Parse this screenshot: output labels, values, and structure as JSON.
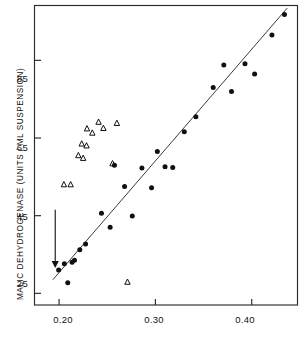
{
  "chart_data": {
    "type": "scatter",
    "title": "",
    "xlabel": "",
    "ylabel": "MALIC DEHYDROGENASE (UNITS / ML SUSPENSION)",
    "xlim": [
      0.175,
      0.447
    ],
    "ylim": [
      22.0,
      99.0
    ],
    "xticks": [
      0.2,
      0.3,
      0.4
    ],
    "xticklabels": [
      "0.20",
      "0.30",
      "0.40"
    ],
    "yticks": [
      25,
      45,
      65,
      85
    ],
    "yticklabels": [
      "25",
      "45",
      "65",
      "85"
    ],
    "grid": false,
    "legend": null,
    "frame": "box",
    "series": [
      {
        "name": "filled-circles",
        "marker": "filled-circle",
        "color": "#101010",
        "points": [
          [
            0.1995,
            31.0
          ],
          [
            0.2055,
            32.6
          ],
          [
            0.209,
            27.7
          ],
          [
            0.2135,
            33.0
          ],
          [
            0.216,
            33.5
          ],
          [
            0.2215,
            36.2
          ],
          [
            0.2275,
            37.7
          ],
          [
            0.244,
            45.6
          ],
          [
            0.253,
            42.0
          ],
          [
            0.2575,
            58.0
          ],
          [
            0.268,
            52.5
          ],
          [
            0.276,
            44.9
          ],
          [
            0.286,
            57.3
          ],
          [
            0.296,
            52.2
          ],
          [
            0.302,
            61.5
          ],
          [
            0.31,
            57.6
          ],
          [
            0.318,
            57.4
          ],
          [
            0.33,
            66.6
          ],
          [
            0.342,
            70.5
          ],
          [
            0.36,
            78.0
          ],
          [
            0.371,
            83.8
          ],
          [
            0.379,
            77.0
          ],
          [
            0.393,
            84.1
          ],
          [
            0.403,
            81.5
          ],
          [
            0.421,
            91.5
          ],
          [
            0.434,
            96.8
          ]
        ]
      },
      {
        "name": "open-triangles",
        "marker": "open-triangle",
        "color": "#101010",
        "points": [
          [
            0.205,
            53.0
          ],
          [
            0.212,
            53.0
          ],
          [
            0.22,
            60.5
          ],
          [
            0.2235,
            63.5
          ],
          [
            0.225,
            59.8
          ],
          [
            0.2285,
            63.0
          ],
          [
            0.229,
            67.4
          ],
          [
            0.2345,
            66.3
          ],
          [
            0.241,
            69.1
          ],
          [
            0.246,
            67.5
          ],
          [
            0.26,
            68.8
          ],
          [
            0.2555,
            58.4
          ],
          [
            0.271,
            27.9
          ]
        ]
      }
    ],
    "fit_line": {
      "name": "regression-line",
      "x": [
        0.1935,
        0.437
      ],
      "y": [
        28.5,
        98.5
      ],
      "color": "#3c3c3c"
    },
    "annotations": [
      {
        "name": "down-arrow",
        "type": "arrow",
        "x": 0.196,
        "y_start": 46.5,
        "y_end": 31.5,
        "direction": "down",
        "color": "#111111"
      }
    ]
  },
  "axis": {
    "ylabel": "MALIC DEHYDROGENASE (UNITS / ML SUSPENSION)",
    "ytick_0": "25",
    "ytick_1": "45",
    "ytick_2": "65",
    "ytick_3": "85",
    "xtick_0": "0.20",
    "xtick_1": "0.30",
    "xtick_2": "0.40"
  }
}
